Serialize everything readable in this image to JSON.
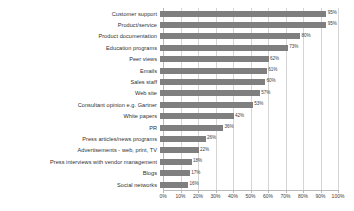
{
  "chart_data": {
    "type": "bar",
    "orientation": "horizontal",
    "title": "",
    "xlabel": "",
    "ylabel": "",
    "xlim": [
      0,
      100
    ],
    "grid": true,
    "legend": false,
    "tick_suffix": "%",
    "tick_labels": [
      "0%",
      "10%",
      "20%",
      "30%",
      "40%",
      "50%",
      "60%",
      "70%",
      "80%",
      "90%",
      "100%"
    ],
    "tick_values": [
      0,
      10,
      20,
      30,
      40,
      50,
      60,
      70,
      80,
      90,
      100
    ],
    "bar_color": "#7f7f7f",
    "gridline_color": "#d5d5d5",
    "categories": [
      "Customer support",
      "Product/service",
      "Product documentation",
      "Education programs",
      "Peer views",
      "Emails",
      "Sales staff",
      "Web site",
      "Consultant opinion e.g. Gartner",
      "White papers",
      "PR",
      "Press articles/news programs",
      "Advertisements - web, print, TV",
      "Press interviews with vendor management",
      "Blogs",
      "Social networks"
    ],
    "values": [
      95,
      95,
      80,
      73,
      62,
      61,
      60,
      57,
      53,
      42,
      36,
      26,
      22,
      18,
      17,
      16
    ],
    "value_labels": [
      "95%",
      "95%",
      "80%",
      "73%",
      "62%",
      "61%",
      "60%",
      "57%",
      "53%",
      "42%",
      "36%",
      "26%",
      "22%",
      "18%",
      "17%",
      "16%"
    ]
  }
}
